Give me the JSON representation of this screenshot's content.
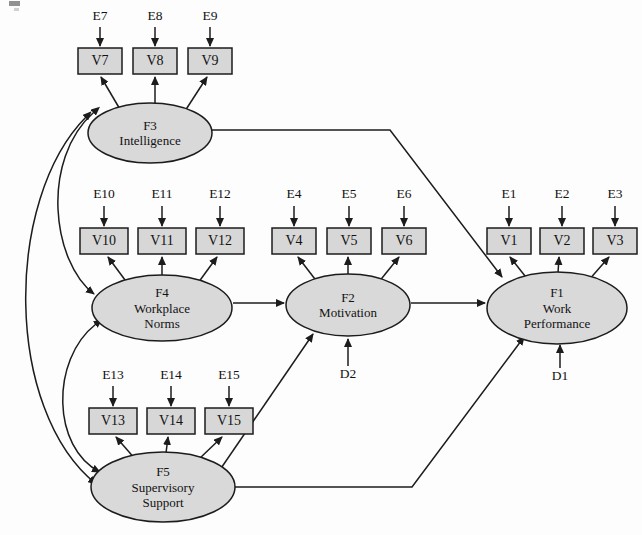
{
  "diagram": {
    "type": "sem-path-diagram",
    "colors": {
      "node_fill": "#d9d9d9",
      "node_stroke": "#1c1c1c",
      "background": "#fdfdfd",
      "text": "#121212"
    },
    "factors": [
      {
        "id": "F3",
        "code": "F3",
        "name": "Intelligence",
        "lines": [
          "F3",
          "Intelligence"
        ],
        "cx": 150,
        "cy": 133,
        "rx": 62,
        "ry": 30
      },
      {
        "id": "F4",
        "code": "F4",
        "name": "Workplace Norms",
        "lines": [
          "F4",
          "Workplace",
          "Norms"
        ],
        "cx": 162,
        "cy": 308,
        "rx": 70,
        "ry": 33
      },
      {
        "id": "F2",
        "code": "F2",
        "name": "Motivation",
        "lines": [
          "F2",
          "Motivation"
        ],
        "cx": 348,
        "cy": 305,
        "rx": 62,
        "ry": 31
      },
      {
        "id": "F1",
        "code": "F1",
        "name": "Work Performance",
        "lines": [
          "F1",
          "Work",
          "Performance"
        ],
        "cx": 557,
        "cy": 308,
        "rx": 70,
        "ry": 36
      },
      {
        "id": "F5",
        "code": "F5",
        "name": "Supervisory Support",
        "lines": [
          "F5",
          "Supervisory",
          "Support"
        ],
        "cx": 163,
        "cy": 487,
        "rx": 72,
        "ry": 35
      }
    ],
    "indicators": [
      {
        "id": "V7",
        "label": "V7",
        "x": 78,
        "y": 48,
        "w": 44,
        "h": 26,
        "factor": "F3"
      },
      {
        "id": "V8",
        "label": "V8",
        "x": 133,
        "y": 48,
        "w": 44,
        "h": 26,
        "factor": "F3"
      },
      {
        "id": "V9",
        "label": "V9",
        "x": 188,
        "y": 48,
        "w": 44,
        "h": 26,
        "factor": "F3"
      },
      {
        "id": "V10",
        "label": "V10",
        "x": 80,
        "y": 228,
        "w": 48,
        "h": 26,
        "factor": "F4"
      },
      {
        "id": "V11",
        "label": "V11",
        "x": 138,
        "y": 228,
        "w": 48,
        "h": 26,
        "factor": "F4"
      },
      {
        "id": "V12",
        "label": "V12",
        "x": 196,
        "y": 228,
        "w": 48,
        "h": 26,
        "factor": "F4"
      },
      {
        "id": "V4",
        "label": "V4",
        "x": 272,
        "y": 228,
        "w": 44,
        "h": 26,
        "factor": "F2"
      },
      {
        "id": "V5",
        "label": "V5",
        "x": 327,
        "y": 228,
        "w": 44,
        "h": 26,
        "factor": "F2"
      },
      {
        "id": "V6",
        "label": "V6",
        "x": 382,
        "y": 228,
        "w": 44,
        "h": 26,
        "factor": "F2"
      },
      {
        "id": "V1",
        "label": "V1",
        "x": 487,
        "y": 228,
        "w": 44,
        "h": 26,
        "factor": "F1"
      },
      {
        "id": "V2",
        "label": "V2",
        "x": 540,
        "y": 228,
        "w": 44,
        "h": 26,
        "factor": "F1"
      },
      {
        "id": "V3",
        "label": "V3",
        "x": 593,
        "y": 228,
        "w": 44,
        "h": 26,
        "factor": "F1"
      },
      {
        "id": "V13",
        "label": "V13",
        "x": 89,
        "y": 408,
        "w": 48,
        "h": 26,
        "factor": "F5"
      },
      {
        "id": "V14",
        "label": "V14",
        "x": 147,
        "y": 408,
        "w": 48,
        "h": 26,
        "factor": "F5"
      },
      {
        "id": "V15",
        "label": "V15",
        "x": 205,
        "y": 408,
        "w": 48,
        "h": 26,
        "factor": "F5"
      }
    ],
    "errors": [
      {
        "id": "E7",
        "label": "E7",
        "lx": 100,
        "ly": 20,
        "ax": 100,
        "ay": 27,
        "ty": 46,
        "target": "V7"
      },
      {
        "id": "E8",
        "label": "E8",
        "lx": 155,
        "ly": 20,
        "ax": 155,
        "ay": 27,
        "ty": 46,
        "target": "V8"
      },
      {
        "id": "E9",
        "label": "E9",
        "lx": 210,
        "ly": 20,
        "ax": 210,
        "ay": 27,
        "ty": 46,
        "target": "V9"
      },
      {
        "id": "E10",
        "label": "E10",
        "lx": 104,
        "ly": 198,
        "ax": 104,
        "ay": 206,
        "ty": 226,
        "target": "V10"
      },
      {
        "id": "E11",
        "label": "E11",
        "lx": 162,
        "ly": 198,
        "ax": 162,
        "ay": 206,
        "ty": 226,
        "target": "V11"
      },
      {
        "id": "E12",
        "label": "E12",
        "lx": 220,
        "ly": 198,
        "ax": 220,
        "ay": 206,
        "ty": 226,
        "target": "V12"
      },
      {
        "id": "E4",
        "label": "E4",
        "lx": 294,
        "ly": 198,
        "ax": 294,
        "ay": 206,
        "ty": 226,
        "target": "V4"
      },
      {
        "id": "E5",
        "label": "E5",
        "lx": 349,
        "ly": 198,
        "ax": 349,
        "ay": 206,
        "ty": 226,
        "target": "V5"
      },
      {
        "id": "E6",
        "label": "E6",
        "lx": 404,
        "ly": 198,
        "ax": 404,
        "ay": 206,
        "ty": 226,
        "target": "V6"
      },
      {
        "id": "E1",
        "label": "E1",
        "lx": 509,
        "ly": 198,
        "ax": 509,
        "ay": 206,
        "ty": 226,
        "target": "V1"
      },
      {
        "id": "E2",
        "label": "E2",
        "lx": 562,
        "ly": 198,
        "ax": 562,
        "ay": 206,
        "ty": 226,
        "target": "V2"
      },
      {
        "id": "E3",
        "label": "E3",
        "lx": 615,
        "ly": 198,
        "ax": 615,
        "ay": 206,
        "ty": 226,
        "target": "V3"
      },
      {
        "id": "E13",
        "label": "E13",
        "lx": 113,
        "ly": 379,
        "ax": 113,
        "ay": 386,
        "ty": 406,
        "target": "V13"
      },
      {
        "id": "E14",
        "label": "E14",
        "lx": 171,
        "ly": 379,
        "ax": 171,
        "ay": 386,
        "ty": 406,
        "target": "V14"
      },
      {
        "id": "E15",
        "label": "E15",
        "lx": 229,
        "ly": 379,
        "ax": 229,
        "ay": 386,
        "ty": 406,
        "target": "V15"
      }
    ],
    "disturbances": [
      {
        "id": "D2",
        "label": "D2",
        "lx": 348,
        "ly": 378,
        "ax": 348,
        "ay": 366,
        "ty": 339,
        "target": "F2"
      },
      {
        "id": "D1",
        "label": "D1",
        "lx": 560,
        "ly": 380,
        "ax": 560,
        "ay": 368,
        "ty": 345,
        "target": "F1"
      }
    ],
    "loadings": [
      {
        "from": "F3",
        "to": "V7",
        "x1": 121,
        "y1": 111,
        "x2": 101,
        "y2": 77
      },
      {
        "from": "F3",
        "to": "V8",
        "x1": 155,
        "y1": 105,
        "x2": 155,
        "y2": 77
      },
      {
        "from": "F3",
        "to": "V9",
        "x1": 185,
        "y1": 111,
        "x2": 207,
        "y2": 77
      },
      {
        "from": "F4",
        "to": "V10",
        "x1": 128,
        "y1": 284,
        "x2": 108,
        "y2": 257
      },
      {
        "from": "F4",
        "to": "V11",
        "x1": 162,
        "y1": 277,
        "x2": 162,
        "y2": 257
      },
      {
        "from": "F4",
        "to": "V12",
        "x1": 198,
        "y1": 283,
        "x2": 217,
        "y2": 257
      },
      {
        "from": "F2",
        "to": "V4",
        "x1": 318,
        "y1": 283,
        "x2": 298,
        "y2": 257
      },
      {
        "from": "F2",
        "to": "V5",
        "x1": 348,
        "y1": 276,
        "x2": 348,
        "y2": 257
      },
      {
        "from": "F2",
        "to": "V6",
        "x1": 378,
        "y1": 283,
        "x2": 399,
        "y2": 257
      },
      {
        "from": "F1",
        "to": "V1",
        "x1": 529,
        "y1": 281,
        "x2": 510,
        "y2": 257
      },
      {
        "from": "F1",
        "to": "V2",
        "x1": 558,
        "y1": 273,
        "x2": 559,
        "y2": 257
      },
      {
        "from": "F1",
        "to": "V3",
        "x1": 588,
        "y1": 281,
        "x2": 609,
        "y2": 257
      },
      {
        "from": "F5",
        "to": "V13",
        "x1": 136,
        "y1": 460,
        "x2": 116,
        "y2": 437
      },
      {
        "from": "F5",
        "to": "V14",
        "x1": 166,
        "y1": 453,
        "x2": 168,
        "y2": 437
      },
      {
        "from": "F5",
        "to": "V15",
        "x1": 199,
        "y1": 459,
        "x2": 222,
        "y2": 437
      }
    ],
    "structural_paths": [
      {
        "id": "F4-F2",
        "from": "F4",
        "to": "F2",
        "d": "M 233 303 L 284 303"
      },
      {
        "id": "F2-F1",
        "from": "F2",
        "to": "F1",
        "d": "M 411 303 L 485 303"
      },
      {
        "id": "F3-F1",
        "from": "F3",
        "to": "F1",
        "d": "M 212 130 L 390 130 L 502 277"
      },
      {
        "id": "F5-F2",
        "from": "F5",
        "to": "F2",
        "d": "M 215 477 L 313 334"
      },
      {
        "id": "F5-F1",
        "from": "F5",
        "to": "F1",
        "d": "M 233 487 L 412 487 L 524 337"
      }
    ],
    "covariances": [
      {
        "id": "F3-F4",
        "from": "F3",
        "to": "F4",
        "d": "M 94 112 C 40 160, 52 262, 94 294"
      },
      {
        "id": "F4-F5",
        "from": "F4",
        "to": "F5",
        "d": "M 96 324 C 50 360, 52 448, 100 472"
      },
      {
        "id": "F3-F5",
        "from": "F3",
        "to": "F5",
        "d": "M 86 117 C 4 200, 4 410, 96 484"
      }
    ]
  }
}
